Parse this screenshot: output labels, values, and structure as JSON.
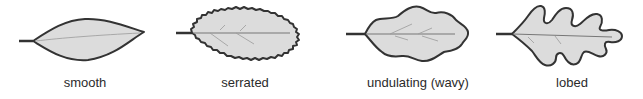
{
  "diagram": {
    "leaves": [
      {
        "id": "smooth",
        "label": "smooth",
        "label_x": 85
      },
      {
        "id": "serrated",
        "label": "serrated",
        "label_x": 245
      },
      {
        "id": "undulating",
        "label": "undulating (wavy)",
        "label_x": 418
      },
      {
        "id": "lobed",
        "label": "lobed",
        "label_x": 572
      }
    ],
    "colors": {
      "leaf_fill": "#dcdcdc",
      "outline": "#333333",
      "vein": "#777777",
      "text": "#2b2b2b",
      "background": "#ffffff"
    }
  }
}
